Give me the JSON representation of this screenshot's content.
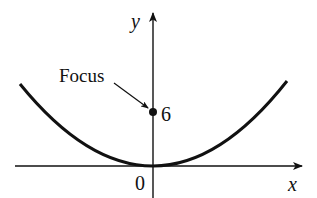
{
  "diagram": {
    "type": "parabola",
    "axes": {
      "x_label": "x",
      "y_label": "y",
      "origin_label": "0"
    },
    "focus": {
      "label": "Focus",
      "value_label": "6",
      "point": [
        0,
        6
      ]
    },
    "vertex": [
      0,
      0
    ],
    "colors": {
      "ink": "#111111",
      "background": "#ffffff"
    }
  }
}
